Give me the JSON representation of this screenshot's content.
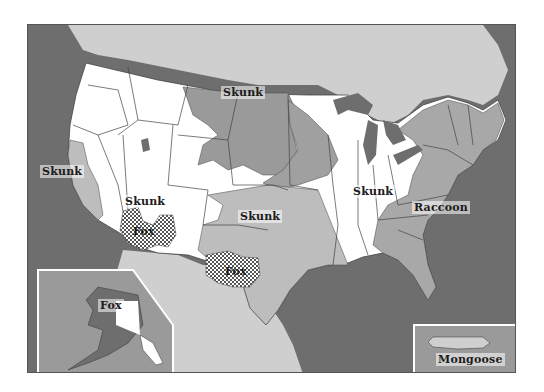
{
  "map": {
    "title": "Rabies reservoir species distribution (United States)",
    "colors": {
      "ocean": "#6e6e6e",
      "foreign_land": "#cfcfcf",
      "no_reservoir": "#ffffff",
      "skunk_region_dark": "#9a9a9a",
      "skunk_region_light": "#bdbdbd",
      "raccoon_region": "#a8a8a8",
      "lakes": "#6e6e6e",
      "fox_pattern": "checkered"
    },
    "labels": {
      "skunk_north_central": "Skunk",
      "skunk_california": "Skunk",
      "skunk_southwest": "Skunk",
      "skunk_south_central": "Skunk",
      "skunk_east_central": "Skunk",
      "fox_arizona": "Fox",
      "fox_texas": "Fox",
      "fox_alaska": "Fox",
      "raccoon_east": "Raccoon",
      "mongoose_puerto_rico": "Mongoose"
    },
    "insets": {
      "alaska": "Alaska inset",
      "puerto_rico": "Puerto Rico inset"
    }
  }
}
